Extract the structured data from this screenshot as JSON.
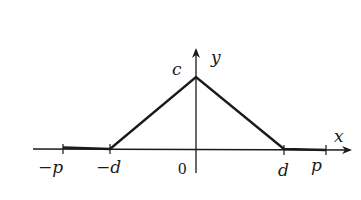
{
  "diagram": {
    "type": "triangular-pulse-graph",
    "colors": {
      "background": "#ffffff",
      "ink": "#1a1a1a"
    },
    "axes": {
      "x_label": "x",
      "y_label": "y",
      "origin_label": "0"
    },
    "labels": {
      "peak": "c",
      "neg_p": "−p",
      "neg_d": "−d",
      "pos_d": "d",
      "pos_p": "p"
    },
    "function": {
      "description": "y = c at x = 0, decreasing linearly to 0 at x = ±d, y = 0 for d ≤ |x| ≤ p",
      "points": [
        [
          "-p",
          0
        ],
        [
          "-d",
          0
        ],
        [
          "0",
          "c"
        ],
        [
          "d",
          0
        ],
        [
          "p",
          0
        ]
      ]
    }
  }
}
